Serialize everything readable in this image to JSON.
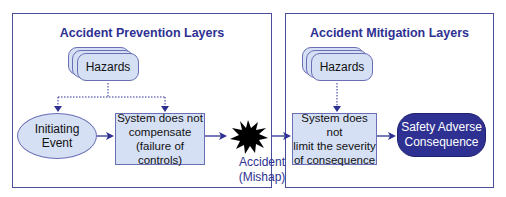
{
  "prevention": {
    "title": "Accident Prevention Layers",
    "hazards": "Hazards",
    "initiating_event": "Initiating\nEvent",
    "initiating_event_line1": "Initiating",
    "initiating_event_line2": "Event",
    "system_box_line1": "System does not",
    "system_box_line2": "compensate",
    "system_box_line3": "(failure of controls)"
  },
  "accident": {
    "line1": "Accident",
    "line2": "(Mishap)",
    "icon": "explosion-burst-icon"
  },
  "mitigation": {
    "title": "Accident Mitigation Layers",
    "hazards": "Hazards",
    "system_box_line1": "System does not",
    "system_box_line2": "limit the severity",
    "system_box_line3": "of consequence",
    "consequence_line1": "Safety Adverse",
    "consequence_line2": "Consequence"
  },
  "colors": {
    "panel_border": "#4a4d9c",
    "title_text": "#2e3192",
    "box_fill": "#d6e0f5",
    "box_border": "#6a6fb5",
    "consequence_fill": "#2e3192",
    "arrow": "#2e3192",
    "burst": "#000000"
  }
}
